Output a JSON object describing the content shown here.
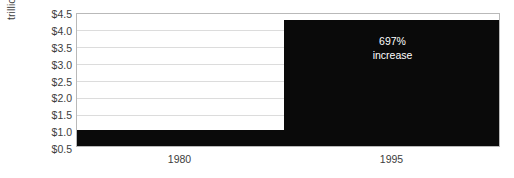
{
  "chart_data": {
    "type": "bar",
    "title": "",
    "subtitle": "",
    "xlabel": "",
    "ylabel": "trillions of U.S. dollars",
    "categories": [
      "1980",
      "1995"
    ],
    "values": [
      0.54,
      4.3
    ],
    "series": [
      {
        "name": "trillions of U.S. dollars",
        "values": [
          0.54,
          4.3
        ],
        "color": "#0a0a0a"
      }
    ],
    "ylim": [
      0.0,
      4.5
    ],
    "y_tick_labels": [
      "$4.5",
      "$4.0",
      "$3.5",
      "$3.0",
      "$2.5",
      "$2.0",
      "$1.5",
      "$1.0",
      "$0.5"
    ],
    "y_tick_values": [
      4.5,
      4.0,
      3.5,
      3.0,
      2.5,
      2.0,
      1.5,
      1.0,
      0.5
    ],
    "x_tick_labels": [
      "1980",
      "1995"
    ],
    "grid": true,
    "grid_axis": "y",
    "legend": false,
    "legend_position": "none",
    "annotations": [
      {
        "text_lines": [
          "697%",
          "increase"
        ],
        "value": "697%",
        "label": "increase",
        "attached_to": "1995",
        "color": "#ffffff"
      }
    ],
    "colors": {
      "bar": "#0a0a0a",
      "gridline": "#dcdcdc",
      "axis_border": "#b9b9b9",
      "text": "#3d3d3d",
      "annotation_text": "#ffffff",
      "background": "#ffffff"
    }
  }
}
